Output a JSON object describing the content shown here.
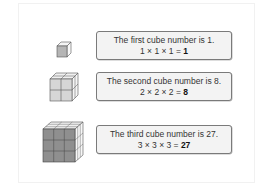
{
  "items": [
    {
      "sentence": "The first cube number is 1.",
      "expr": "1 × 1 × 1 = ",
      "result": "1",
      "cube_size": 1
    },
    {
      "sentence": "The second cube number is 8.",
      "expr": "2 × 2 × 2 = ",
      "result": "8",
      "cube_size": 2
    },
    {
      "sentence": "The third cube number is 27.",
      "expr": "3 × 3 × 3 = ",
      "result": "27",
      "cube_size": 3
    }
  ],
  "colors": {
    "front_face": "#9a9a9a",
    "light_face": "#e6e6e6",
    "side_face": "#f6f6f6",
    "edge": "#555555"
  }
}
